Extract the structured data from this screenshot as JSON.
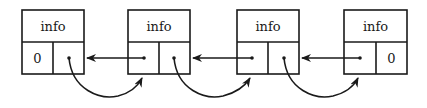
{
  "diagram": {
    "type": "doubly-linked-list",
    "nodes": [
      {
        "info": "info",
        "left": "0",
        "right": "pointer"
      },
      {
        "info": "info",
        "left": "pointer",
        "right": "pointer"
      },
      {
        "info": "info",
        "left": "pointer",
        "right": "pointer"
      },
      {
        "info": "info",
        "left": "pointer",
        "right": "0"
      }
    ],
    "labels": {
      "n0_info": "info",
      "n0_left": "0",
      "n1_info": "info",
      "n2_info": "info",
      "n3_info": "info",
      "n3_right": "0"
    },
    "edges": [
      {
        "from": "node2.left",
        "to": "node1",
        "style": "straight-back"
      },
      {
        "from": "node3.left",
        "to": "node2",
        "style": "straight-back"
      },
      {
        "from": "node4.left",
        "to": "node3",
        "style": "straight-back"
      },
      {
        "from": "node1.right",
        "to": "node2",
        "style": "curved-forward"
      },
      {
        "from": "node2.right",
        "to": "node3",
        "style": "curved-forward"
      },
      {
        "from": "node3.right",
        "to": "node4",
        "style": "curved-forward"
      }
    ]
  }
}
